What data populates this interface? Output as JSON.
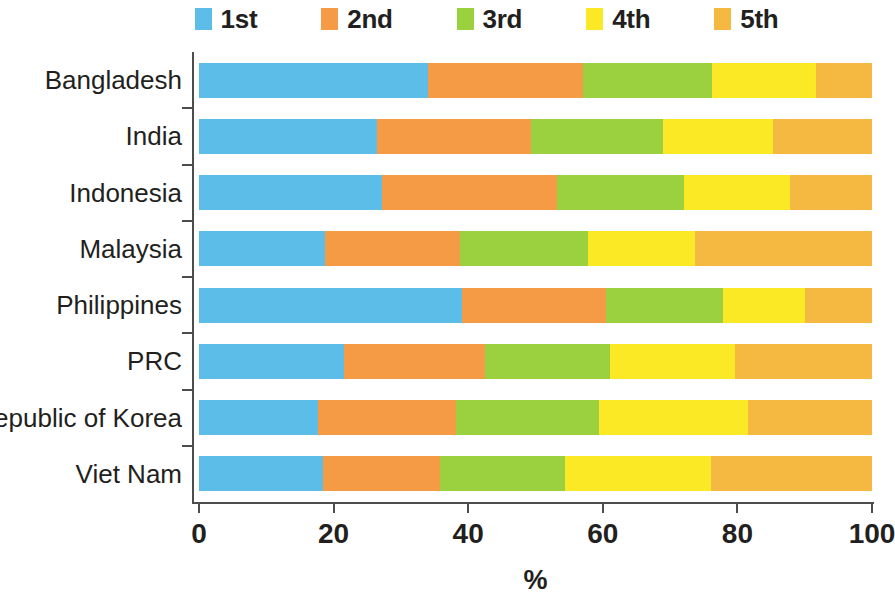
{
  "chart_data": {
    "type": "bar",
    "orientation": "horizontal",
    "stacked": true,
    "title": "",
    "xlabel": "%",
    "ylabel": "",
    "xlim": [
      0,
      100
    ],
    "xticks": [
      0,
      20,
      40,
      60,
      80,
      100
    ],
    "xtick_labels": [
      "0",
      "20",
      "40",
      "60",
      "80",
      "100"
    ],
    "grid": false,
    "legend_position": "top",
    "categories": [
      "Bangladesh",
      "India",
      "Indonesia",
      "Malaysia",
      "Philippines",
      "PRC",
      "Republic of Korea",
      "Viet Nam"
    ],
    "series": [
      {
        "name": "1st",
        "color": "#5BBDE8",
        "values": [
          34.0,
          26.5,
          27.2,
          18.7,
          39.1,
          21.6,
          17.7,
          18.4
        ]
      },
      {
        "name": "2nd",
        "color": "#F59A45",
        "values": [
          23.0,
          22.8,
          26.0,
          20.1,
          21.4,
          20.9,
          20.5,
          17.4
        ]
      },
      {
        "name": "3rd",
        "color": "#9BD03F",
        "values": [
          19.2,
          19.7,
          18.9,
          19.0,
          17.4,
          18.6,
          21.3,
          18.6
        ]
      },
      {
        "name": "4th",
        "color": "#FCE926",
        "values": [
          15.5,
          16.3,
          15.7,
          15.9,
          12.2,
          18.5,
          22.1,
          21.7
        ]
      },
      {
        "name": "5th",
        "color": "#F5B942",
        "values": [
          8.3,
          14.7,
          12.2,
          26.3,
          9.9,
          20.4,
          18.4,
          23.9
        ]
      }
    ]
  },
  "legend": {
    "items": [
      {
        "label": "1st",
        "color": "#5BBDE8"
      },
      {
        "label": "2nd",
        "color": "#F59A45"
      },
      {
        "label": "3rd",
        "color": "#9BD03F"
      },
      {
        "label": "4th",
        "color": "#FCE926"
      },
      {
        "label": "5th",
        "color": "#F5B942"
      }
    ]
  },
  "axis": {
    "x_title": "%",
    "tick_labels": [
      "0",
      "20",
      "40",
      "60",
      "80",
      "100"
    ]
  }
}
